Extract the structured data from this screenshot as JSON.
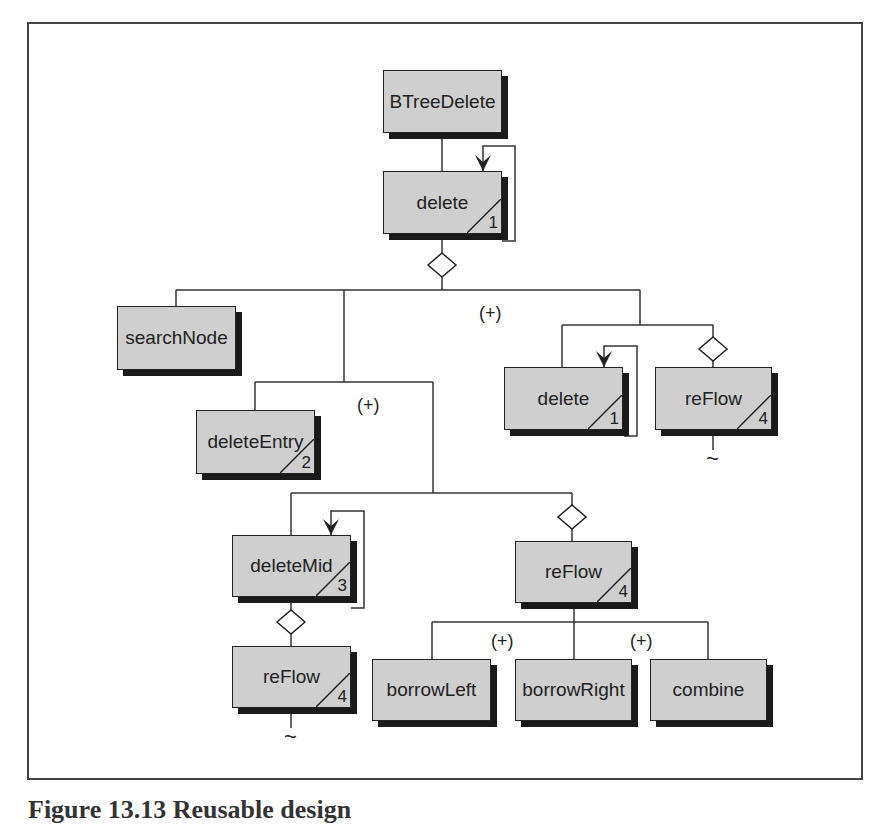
{
  "diagram": {
    "type": "structure-chart",
    "colors": {
      "box_fill": "#cfcfcf",
      "box_border": "#222222",
      "shadow": "#1a1a1a",
      "line": "#333333",
      "frame": "#444444"
    },
    "nodes": [
      {
        "id": "n_btreedelete",
        "label": "BTreeDelete",
        "x": 383,
        "y": 70,
        "w": 119,
        "h": 63,
        "ref": null
      },
      {
        "id": "n_delete_top",
        "label": "delete",
        "x": 383,
        "y": 171,
        "w": 119,
        "h": 63,
        "ref": "1"
      },
      {
        "id": "n_searchnode",
        "label": "searchNode",
        "x": 117,
        "y": 306,
        "w": 119,
        "h": 64,
        "ref": null
      },
      {
        "id": "n_deleteentry",
        "label": "deleteEntry",
        "x": 196,
        "y": 410,
        "w": 119,
        "h": 64,
        "ref": "2"
      },
      {
        "id": "n_delete_right",
        "label": "delete",
        "x": 504,
        "y": 367,
        "w": 119,
        "h": 63,
        "ref": "1"
      },
      {
        "id": "n_reflow_right",
        "label": "reFlow",
        "x": 655,
        "y": 367,
        "w": 117,
        "h": 63,
        "ref": "4"
      },
      {
        "id": "n_deletemid",
        "label": "deleteMid",
        "x": 232,
        "y": 535,
        "w": 119,
        "h": 62,
        "ref": "3"
      },
      {
        "id": "n_reflow_mid",
        "label": "reFlow",
        "x": 515,
        "y": 541,
        "w": 117,
        "h": 62,
        "ref": "4"
      },
      {
        "id": "n_reflow_left",
        "label": "reFlow",
        "x": 232,
        "y": 646,
        "w": 119,
        "h": 62,
        "ref": "4"
      },
      {
        "id": "n_borrowleft",
        "label": "borrowLeft",
        "x": 372,
        "y": 659,
        "w": 119,
        "h": 62,
        "ref": null
      },
      {
        "id": "n_borrowright",
        "label": "borrowRight",
        "x": 515,
        "y": 659,
        "w": 117,
        "h": 62,
        "ref": null
      },
      {
        "id": "n_combine",
        "label": "combine",
        "x": 650,
        "y": 659,
        "w": 117,
        "h": 62,
        "ref": null
      }
    ],
    "edges": [
      "M442 133 L442 171",
      "M442 240 L442 253",
      "M442 277 L442 290",
      "M176 290 L640 290",
      "M176 290 L176 306",
      "M344 290 L344 382",
      "M255 382 L433 382",
      "M255 382 L255 410",
      "M433 382 L433 493",
      "M291 493 L572 493",
      "M291 493 L291 535",
      "M572 493 L572 505",
      "M572 529 L572 541",
      "M291 603 L291 610",
      "M291 634 L291 646",
      "M291 714 L291 728",
      "M574 609 L574 622",
      "M432 622 L708 622",
      "M432 622 L432 659",
      "M574 622 L574 659",
      "M708 622 L708 659",
      "M640 290 L640 325",
      "M562 325 L713 325",
      "M562 325 L562 367",
      "M713 325 L713 337",
      "M713 361 L713 367",
      "M713 436 L713 450"
    ],
    "loops": [
      {
        "id": "loop_delete_top",
        "path": "M483 171 L483 146 L515 146 L515 241 L502 241",
        "arrow_x": 483,
        "arrow_y": 171
      },
      {
        "id": "loop_delete_right",
        "path": "M604 367 L604 346 L637 346 L637 436 L624 436",
        "arrow_x": 604,
        "arrow_y": 367
      },
      {
        "id": "loop_deletemid",
        "path": "M331 535 L331 511 L364 511 L364 608 L351 608",
        "arrow_x": 331,
        "arrow_y": 535
      }
    ],
    "diamonds": [
      {
        "id": "cond_under_delete_top",
        "cx": 442,
        "cy": 265
      },
      {
        "id": "cond_above_reflow_right",
        "cx": 713,
        "cy": 349
      },
      {
        "id": "cond_above_reflow_mid",
        "cx": 572,
        "cy": 517
      },
      {
        "id": "cond_under_deletemid",
        "cx": 291,
        "cy": 622
      }
    ],
    "marks": [
      {
        "id": "plus_top",
        "text": "(+)",
        "x": 479,
        "y": 303
      },
      {
        "id": "plus_middle",
        "text": "(+)",
        "x": 357,
        "y": 395
      },
      {
        "id": "plus_borrowleft",
        "text": "(+)",
        "x": 491,
        "y": 631
      },
      {
        "id": "plus_borrowright",
        "text": "(+)",
        "x": 630,
        "y": 631
      }
    ],
    "tildes": [
      {
        "id": "tilde_reflow_right",
        "text": "~",
        "x": 706,
        "y": 446
      },
      {
        "id": "tilde_reflow_left",
        "text": "~",
        "x": 284,
        "y": 724
      }
    ]
  },
  "caption": {
    "text": "Figure 13.13  Reusable design"
  }
}
